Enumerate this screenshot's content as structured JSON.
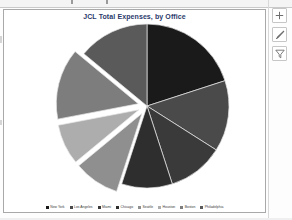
{
  "window": {
    "ghost_text_above": "",
    "background": "#ffffff"
  },
  "chart": {
    "title": "JCL Total Expenses, by Office",
    "title_color": "#2b3a6b",
    "border_color": "#a9a9a9"
  },
  "chart_tools": [
    {
      "name": "chart-elements-button",
      "icon": "plus-icon",
      "label": "+"
    },
    {
      "name": "chart-styles-button",
      "icon": "paintbrush-icon",
      "label": "Chart Styles"
    },
    {
      "name": "chart-filters-button",
      "icon": "funnel-icon",
      "label": "Chart Filters"
    }
  ],
  "chart_data": {
    "type": "pie",
    "title": "JCL Total Expenses, by Office",
    "xlabel": "",
    "ylabel": "",
    "legend_position": "bottom",
    "grid": false,
    "categories": [
      "New York",
      "Los Angeles",
      "Miami",
      "Chicago",
      "Seattle",
      "Houston",
      "Boston",
      "Philadelphia"
    ],
    "values": [
      20,
      14,
      11,
      10,
      9,
      8,
      14,
      14
    ],
    "colors": [
      "#1a1a1a",
      "#4a4a4a",
      "#3a3a3a",
      "#2e2e2e",
      "#8f8f8f",
      "#adadad",
      "#7d7d7d",
      "#5a5a5a"
    ],
    "exploded": [
      false,
      false,
      false,
      false,
      true,
      true,
      true,
      false
    ],
    "start_angle": -90,
    "series_name": "Total Expenses"
  }
}
